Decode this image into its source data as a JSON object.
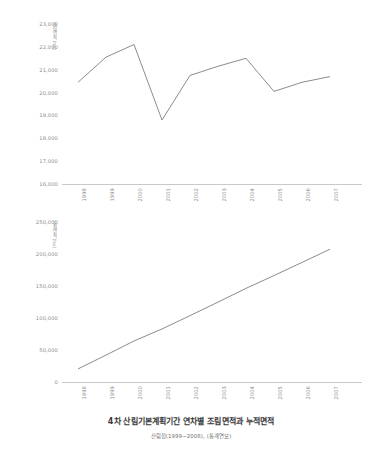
{
  "caption": {
    "title": "4차 산림기본계획기간 연차별 조림면적과 누적면적",
    "subtitle": "산림청(1999~2008), (통계연보)"
  },
  "chart_data": [
    {
      "id": "annual-afforestation",
      "type": "line",
      "title": "",
      "xlabel": "",
      "ylabel": "조림면적 (ha)",
      "categories": [
        "1998",
        "1999",
        "2000",
        "2001",
        "2002",
        "2003",
        "2004",
        "2005",
        "2006",
        "2007"
      ],
      "x": [
        1998,
        1999,
        2000,
        2001,
        2002,
        2003,
        2004,
        2005,
        2006,
        2007
      ],
      "values": [
        20450,
        21550,
        22100,
        18800,
        20750,
        21150,
        21500,
        20050,
        20450,
        20700
      ],
      "yticks": [
        "23,000",
        "22,000",
        "21,000",
        "20,000",
        "19,000",
        "18,000",
        "17,000",
        "16,000"
      ],
      "ytickvalues": [
        23000,
        22000,
        21000,
        20000,
        19000,
        18000,
        17000,
        16000
      ],
      "ylim": [
        16000,
        23000
      ],
      "grid": false,
      "legend": "none",
      "series_color": "#7f7f7f"
    },
    {
      "id": "cumulative-afforestation",
      "type": "line",
      "title": "",
      "xlabel": "",
      "ylabel": "누적면적 (ha)",
      "categories": [
        "1998",
        "1999",
        "2000",
        "2001",
        "2002",
        "2003",
        "2004",
        "2005",
        "2006",
        "2007"
      ],
      "x": [
        1998,
        1999,
        2000,
        2001,
        2002,
        2003,
        2004,
        2005,
        2006,
        2007
      ],
      "values": [
        20450,
        42000,
        64100,
        82900,
        103650,
        124800,
        146300,
        166350,
        186800,
        207500
      ],
      "yticks": [
        "250,000",
        "200,000",
        "150,000",
        "100,000",
        "50,000",
        "0"
      ],
      "ytickvalues": [
        250000,
        200000,
        150000,
        100000,
        50000,
        0
      ],
      "ylim": [
        0,
        250000
      ],
      "grid": false,
      "legend": "none",
      "series_color": "#7f7f7f"
    }
  ]
}
